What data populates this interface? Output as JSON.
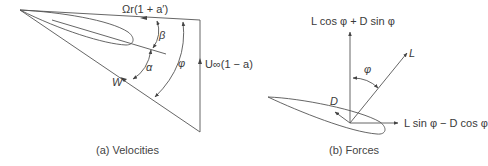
{
  "panel_a": {
    "caption": "(a) Velocities",
    "labels": {
      "tangential_velocity": "Ωr(1 + a′)",
      "axial_velocity": "U∞(1 − a)",
      "relative_velocity": "W",
      "pitch_angle": "β",
      "angle_of_attack": "α",
      "inflow_angle": "φ"
    }
  },
  "panel_b": {
    "caption": "(b) Forces",
    "labels": {
      "normal_force": "L cos φ + D sin φ",
      "lift": "L",
      "drag": "D",
      "inflow_angle": "φ",
      "tangential_force": "L sin φ − D cos φ"
    }
  },
  "colors": {
    "line": "#555555",
    "text": "#3a3a3a",
    "background": "#ffffff"
  }
}
